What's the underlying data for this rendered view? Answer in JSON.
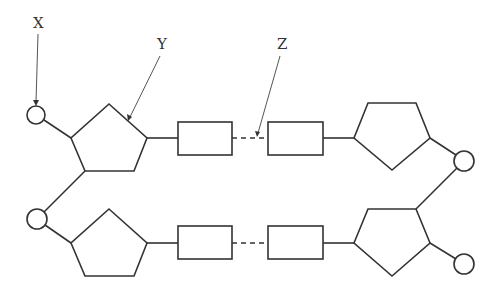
{
  "diagram": {
    "labels": {
      "x": "X",
      "y": "Y",
      "z": "Z"
    },
    "label_meanings": {
      "x": "phosphate group (circle)",
      "y": "deoxyribose sugar (pentagon)",
      "z": "hydrogen bonds between bases (dashed line)"
    },
    "components": {
      "phosphates": 4,
      "sugars": 4,
      "bases": 4,
      "base_pairs": 2
    },
    "colors": {
      "stroke": "#333333",
      "background": "#ffffff"
    }
  }
}
